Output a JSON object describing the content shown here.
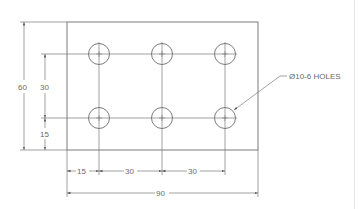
{
  "drawing": {
    "plate": {
      "x": 67,
      "y": 22,
      "width": 191,
      "height": 128,
      "width_mm": 90,
      "height_mm": 60
    },
    "holes": {
      "radius_px": 10.5,
      "columns_x": [
        99,
        162,
        225
      ],
      "rows_y": [
        54,
        118
      ],
      "callout": "Ø10-6 HOLES"
    },
    "dimensions": {
      "overall_height": "60",
      "row_spacing": "30",
      "bottom_row_offset": "15",
      "left_column_offset": "15",
      "column_spacing_1": "30",
      "column_spacing_2": "30",
      "overall_width": "90"
    },
    "colors": {
      "line": "#6e6e6e",
      "text": "#6a6a6a",
      "background": "#ffffff"
    }
  }
}
